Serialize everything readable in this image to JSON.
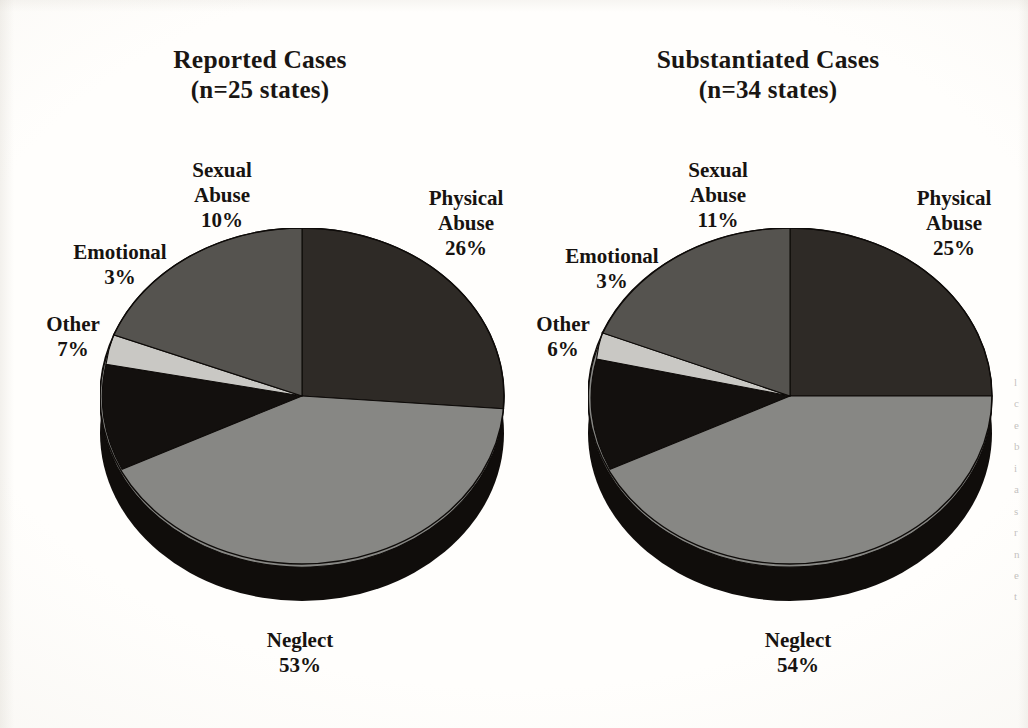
{
  "page": {
    "background_color": "#fdfcfa",
    "text_color": "#1a1613"
  },
  "palette": {
    "physical_abuse": "#2e2a26",
    "neglect": "#878784",
    "other": "#13100e",
    "emotional": "#c9c8c4",
    "sexual_abuse": "#55534f",
    "pie_depth_side": "#100d0b",
    "outline": "#0e0b09"
  },
  "chart_data": [
    {
      "type": "pie",
      "id": "reported-cases",
      "title": "Reported Cases",
      "subtitle": "(n=25 states)",
      "categories": [
        "Physical Abuse",
        "Neglect",
        "Other",
        "Emotional",
        "Sexual Abuse"
      ],
      "values": [
        26,
        53,
        7,
        3,
        10
      ],
      "value_labels": [
        "26%",
        "53%",
        "7%",
        "3%",
        "10%"
      ],
      "colors": [
        "#2e2a26",
        "#878784",
        "#13100e",
        "#c9c8c4",
        "#55534f"
      ],
      "legend": "none",
      "labels_position": "outside",
      "three_d": true,
      "slices": [
        {
          "name": "Physical Abuse",
          "name_line1": "Physical",
          "name_line2": "Abuse",
          "percent": "26%",
          "value": 26,
          "color": "#2e2a26"
        },
        {
          "name": "Neglect",
          "name_line1": "Neglect",
          "name_line2": "",
          "percent": "53%",
          "value": 53,
          "color": "#878784"
        },
        {
          "name": "Other",
          "name_line1": "Other",
          "name_line2": "",
          "percent": "7%",
          "value": 7,
          "color": "#13100e"
        },
        {
          "name": "Emotional",
          "name_line1": "Emotional",
          "name_line2": "",
          "percent": "3%",
          "value": 3,
          "color": "#c9c8c4"
        },
        {
          "name": "Sexual Abuse",
          "name_line1": "Sexual",
          "name_line2": "Abuse",
          "percent": "10%",
          "value": 10,
          "color": "#55534f"
        }
      ]
    },
    {
      "type": "pie",
      "id": "substantiated-cases",
      "title": "Substantiated Cases",
      "subtitle": "(n=34 states)",
      "categories": [
        "Physical Abuse",
        "Neglect",
        "Other",
        "Emotional",
        "Sexual Abuse"
      ],
      "values": [
        25,
        54,
        6,
        3,
        11
      ],
      "value_labels": [
        "25%",
        "54%",
        "6%",
        "3%",
        "11%"
      ],
      "colors": [
        "#2e2a26",
        "#878784",
        "#13100e",
        "#c9c8c4",
        "#55534f"
      ],
      "legend": "none",
      "labels_position": "outside",
      "three_d": true,
      "slices": [
        {
          "name": "Physical Abuse",
          "name_line1": "Physical",
          "name_line2": "Abuse",
          "percent": "25%",
          "value": 25,
          "color": "#2e2a26"
        },
        {
          "name": "Neglect",
          "name_line1": "Neglect",
          "name_line2": "",
          "percent": "54%",
          "value": 54,
          "color": "#878784"
        },
        {
          "name": "Other",
          "name_line1": "Other",
          "name_line2": "",
          "percent": "6%",
          "value": 6,
          "color": "#13100e"
        },
        {
          "name": "Emotional",
          "name_line1": "Emotional",
          "name_line2": "",
          "percent": "3%",
          "value": 3,
          "color": "#c9c8c4"
        },
        {
          "name": "Sexual Abuse",
          "name_line1": "Sexual",
          "name_line2": "Abuse",
          "percent": "11%",
          "value": 11,
          "color": "#55534f"
        }
      ]
    }
  ],
  "charts": {
    "left": {
      "title_main": "Reported Cases",
      "title_sub": "(n=25 states)",
      "labels": {
        "sexual_l1": "Sexual",
        "sexual_l2": "Abuse",
        "sexual_pct": "10%",
        "emotional_name": "Emotional",
        "emotional_pct": "3%",
        "other_name": "Other",
        "other_pct": "7%",
        "physical_l1": "Physical",
        "physical_l2": "Abuse",
        "physical_pct": "26%",
        "neglect_name": "Neglect",
        "neglect_pct": "53%"
      }
    },
    "right": {
      "title_main": "Substantiated Cases",
      "title_sub": "(n=34 states)",
      "labels": {
        "sexual_l1": "Sexual",
        "sexual_l2": "Abuse",
        "sexual_pct": "11%",
        "emotional_name": "Emotional",
        "emotional_pct": "3%",
        "other_name": "Other",
        "other_pct": "6%",
        "physical_l1": "Physical",
        "physical_l2": "Abuse",
        "physical_pct": "25%",
        "neglect_name": "Neglect",
        "neglect_pct": "54%"
      }
    }
  },
  "margin_text": {
    "lines": [
      "l",
      "c",
      "e",
      "b",
      "i",
      "a",
      "s",
      "r",
      "n",
      "e",
      "t"
    ]
  }
}
